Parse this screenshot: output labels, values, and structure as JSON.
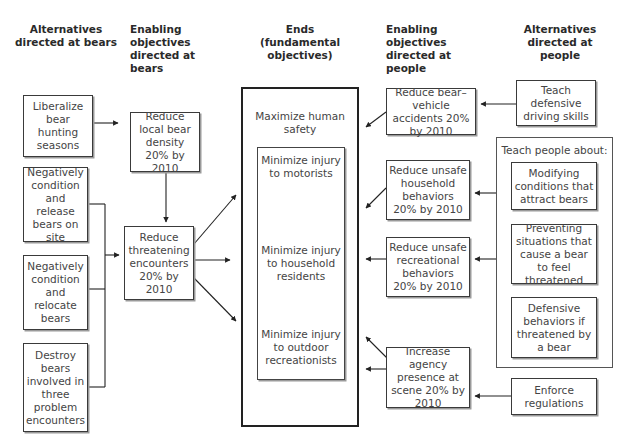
{
  "headers": {
    "alt_bears": "Alternatives directed at bears",
    "enab_bears": "Enabling objectives directed at bears",
    "ends": "Ends (fundamental objectives)",
    "enab_people": "Enabling objectives directed at people",
    "alt_people": "Alternatives directed at people"
  },
  "alternatives_bears": [
    {
      "label": "Liberalize bear hunting seasons"
    },
    {
      "label": "Negatively condition and release bears on site"
    },
    {
      "label": "Negatively condition and relocate bears"
    },
    {
      "label": "Destroy bears involved in three problem encounters"
    }
  ],
  "enabling_bears": [
    {
      "label": "Reduce local bear density 20% by 2010"
    },
    {
      "label": "Reduce threatening encounters 20% by 2010"
    }
  ],
  "ends": {
    "title": "Maximize human safety",
    "sub": [
      {
        "label": "Minimize injury to motorists"
      },
      {
        "label": "Minimize injury to household residents"
      },
      {
        "label": "Minimize injury to outdoor recreationists"
      }
    ]
  },
  "enabling_people": [
    {
      "label": "Reduce bear–vehicle accidents 20% by 2010"
    },
    {
      "label": "Reduce unsafe household behaviors 20% by 2010"
    },
    {
      "label": "Reduce unsafe recreational behaviors 20% by 2010"
    },
    {
      "label": "Increase agency presence at scene 20% by 2010"
    }
  ],
  "alternatives_people": {
    "teach_driving": "Teach defensive driving skills",
    "teach_group_title": "Teach people about:",
    "teach_items": [
      {
        "label": "Modifying conditions that attract bears"
      },
      {
        "label": "Preventing situations that cause a bear to feel threatened"
      },
      {
        "label": "Defensive behaviors if threatened by a bear"
      }
    ],
    "enforce": "Enforce regulations"
  }
}
